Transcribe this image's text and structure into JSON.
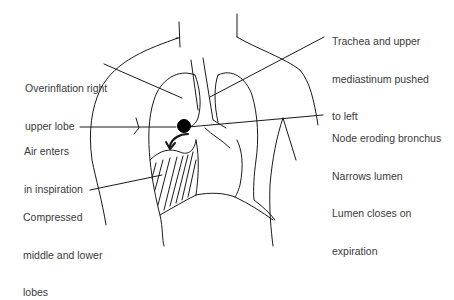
{
  "figure": {
    "line_color": "#1a1a1a",
    "node_color": "#000000"
  },
  "labels": {
    "overinflation": {
      "line1": "Overinflation right",
      "line2": "upper lobe"
    },
    "trachea": {
      "line1": "Trachea and upper",
      "line2": "mediastinum pushed",
      "line3": "to left"
    },
    "air": {
      "line1": "Air enters",
      "line2": "in inspiration"
    },
    "node": {
      "line1": "Node eroding bronchus",
      "line2": "Narrows lumen",
      "line3": "Lumen closes on",
      "line4": "expiration"
    },
    "compressed": {
      "line1": "Compressed",
      "line2": "middle and lower",
      "line3": "lobes"
    }
  }
}
